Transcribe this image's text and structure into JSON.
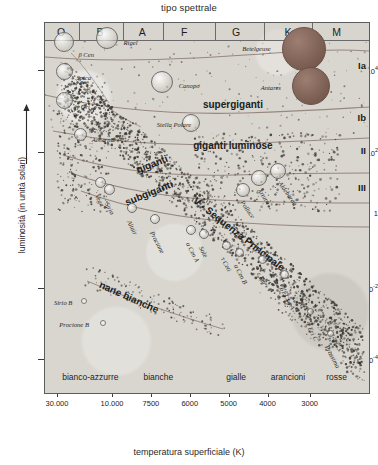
{
  "titles": {
    "top": "tipo spettrale",
    "xlabel": "temperatura superficiale (K)",
    "ylabel": "luminosità (in unità solari)"
  },
  "chart_data": {
    "type": "scatter",
    "xlabel": "temperatura superficiale (K)",
    "ylabel": "luminosità (in unità solari)",
    "top_axis_label": "tipo spettrale",
    "x_axis_inverted": true,
    "x_scale": "log-temperature (decreasing)",
    "y_scale": "log",
    "ylim": [
      "1e-4",
      "1e5"
    ],
    "xlim": [
      40000,
      2500
    ],
    "grid": false,
    "legend": "none",
    "spectral_types": [
      {
        "label": "O",
        "x_pct": 5
      },
      {
        "label": "B",
        "x_pct": 17
      },
      {
        "label": "A",
        "x_pct": 30
      },
      {
        "label": "F",
        "x_pct": 43
      },
      {
        "label": "G",
        "x_pct": 59
      },
      {
        "label": "K",
        "x_pct": 75
      },
      {
        "label": "M",
        "x_pct": 90
      }
    ],
    "spectral_dividers_pct": [
      10.5,
      24,
      36.5,
      52.5,
      67.5,
      82.5
    ],
    "color_classes": [
      {
        "label": "bianco-azzurre",
        "x_pct": 14
      },
      {
        "label": "bianche",
        "x_pct": 35
      },
      {
        "label": "gialle",
        "x_pct": 59
      },
      {
        "label": "arancioni",
        "x_pct": 75
      },
      {
        "label": "rosse",
        "x_pct": 90
      }
    ],
    "x_ticks": [
      {
        "label": "30.000",
        "x_pct": 4
      },
      {
        "label": "10.000",
        "x_pct": 21
      },
      {
        "label": "7500",
        "x_pct": 33
      },
      {
        "label": "6000",
        "x_pct": 45
      },
      {
        "label": "5000",
        "x_pct": 57
      },
      {
        "label": "4000",
        "x_pct": 69
      },
      {
        "label": "3000",
        "x_pct": 82
      }
    ],
    "y_ticks": [
      {
        "mantissa": "10",
        "exponent": "4",
        "y_pct": 13
      },
      {
        "mantissa": "10",
        "exponent": "2",
        "y_pct": 35
      },
      {
        "mantissa": "1",
        "exponent": "",
        "y_pct": 52
      },
      {
        "mantissa": "10",
        "exponent": "-2",
        "y_pct": 72
      },
      {
        "mantissa": "10",
        "exponent": "-4",
        "y_pct": 91
      }
    ],
    "luminosity_classes": [
      {
        "label": "Ia",
        "y_pct": 10
      },
      {
        "label": "Ib",
        "y_pct": 24
      },
      {
        "label": "II",
        "y_pct": 33
      },
      {
        "label": "III",
        "y_pct": 43
      }
    ],
    "regions": [
      {
        "label": "supergiganti",
        "x_pct": 58,
        "y_pct": 22,
        "rotation": 0,
        "size": "big"
      },
      {
        "label": "giganti luminose",
        "x_pct": 58,
        "y_pct": 33,
        "rotation": 0,
        "size": "big"
      },
      {
        "label": "giganti",
        "x_pct": 33,
        "y_pct": 38,
        "rotation": -22,
        "size": "big"
      },
      {
        "label": "subgiganti",
        "x_pct": 32,
        "y_pct": 46,
        "rotation": -22,
        "size": "big"
      },
      {
        "label": "V - Sequenza Principale",
        "x_pct": 60,
        "y_pct": 57,
        "rotation": 38,
        "size": "big"
      },
      {
        "label": "nane bianche",
        "x_pct": 26,
        "y_pct": 74,
        "rotation": 24,
        "size": "big"
      }
    ],
    "stars": [
      {
        "name": "β Cen",
        "x_pct": 6,
        "y_pct": 5,
        "r": 10,
        "label_dx": 14,
        "label_dy": 9,
        "rot": 0
      },
      {
        "name": "Rigel",
        "x_pct": 19,
        "y_pct": 4,
        "r": 11,
        "label_dx": 17,
        "label_dy": 1,
        "rot": 0
      },
      {
        "name": "Spica",
        "x_pct": 6,
        "y_pct": 13,
        "r": 8.5,
        "label_dx": 12,
        "label_dy": 3,
        "rot": 0
      },
      {
        "name": "γ Ori",
        "x_pct": 6,
        "y_pct": 21,
        "r": 8.5,
        "label_dx": 12,
        "label_dy": 2,
        "rot": 0
      },
      {
        "name": "Canopo",
        "x_pct": 36,
        "y_pct": 16,
        "r": 11,
        "label_dx": 17,
        "label_dy": 0,
        "rot": 0
      },
      {
        "name": "Stella Polare",
        "x_pct": 45,
        "y_pct": 27,
        "r": 9,
        "label_dx": -34,
        "label_dy": -2,
        "rot": 0
      },
      {
        "name": "Achernar",
        "x_pct": 11,
        "y_pct": 30,
        "r": 6.5,
        "label_dx": 11,
        "label_dy": 2,
        "rot": 0
      },
      {
        "name": "Betelgeuse",
        "x_pct": 80,
        "y_pct": 7,
        "r": 22,
        "label_dx": -62,
        "label_dy": -4,
        "rot": 0
      },
      {
        "name": "Antares",
        "x_pct": 82,
        "y_pct": 17,
        "r": 19,
        "label_dx": -50,
        "label_dy": -2,
        "rot": 0
      },
      {
        "name": "Aldebaran",
        "x_pct": 72,
        "y_pct": 40,
        "r": 8,
        "label_dx": 5,
        "label_dy": 9,
        "rot": 55
      },
      {
        "name": "Arturo",
        "x_pct": 66,
        "y_pct": 42,
        "r": 8,
        "label_dx": 3,
        "label_dy": 9,
        "rot": 55
      },
      {
        "name": "Polluce",
        "x_pct": 61,
        "y_pct": 45,
        "r": 7,
        "label_dx": 2,
        "label_dy": 9,
        "rot": 55
      },
      {
        "name": "Vega",
        "x_pct": 17,
        "y_pct": 43,
        "r": 5.5,
        "label_dx": 0,
        "label_dy": 11,
        "rot": 62
      },
      {
        "name": "Sirio",
        "x_pct": 20,
        "y_pct": 45,
        "r": 5.5,
        "label_dx": 0,
        "label_dy": 11,
        "rot": 62
      },
      {
        "name": "Altair",
        "x_pct": 27,
        "y_pct": 50,
        "r": 5,
        "label_dx": 0,
        "label_dy": 11,
        "rot": 62
      },
      {
        "name": "Procione",
        "x_pct": 34,
        "y_pct": 53,
        "r": 5,
        "label_dx": 0,
        "label_dy": 11,
        "rot": 62
      },
      {
        "name": "α Cen A",
        "x_pct": 45,
        "y_pct": 56,
        "r": 5,
        "label_dx": 0,
        "label_dy": 11,
        "rot": 62
      },
      {
        "name": "Sole",
        "x_pct": 49,
        "y_pct": 57,
        "r": 5,
        "label_dx": 0,
        "label_dy": 11,
        "rot": 62
      },
      {
        "name": "τ Ceti",
        "x_pct": 56,
        "y_pct": 60,
        "r": 4.5,
        "label_dx": 0,
        "label_dy": 11,
        "rot": 62
      },
      {
        "name": "α Cen B",
        "x_pct": 60,
        "y_pct": 62,
        "r": 4.5,
        "label_dx": 0,
        "label_dy": 11,
        "rot": 62
      },
      {
        "name": "ε Eri",
        "x_pct": 67,
        "y_pct": 64,
        "r": 4.5,
        "label_dx": 0,
        "label_dy": 11,
        "rot": 62
      },
      {
        "name": "61 Cyg A",
        "x_pct": 74,
        "y_pct": 68,
        "r": 4.5,
        "label_dx": 0,
        "label_dy": 11,
        "rot": 62
      },
      {
        "name": "ε Eri C",
        "x_pct": 82,
        "y_pct": 78,
        "r": 3.5,
        "label_dx": 0,
        "label_dy": 10,
        "rot": 62
      },
      {
        "name": "Prossima",
        "x_pct": 88,
        "y_pct": 84,
        "r": 3.5,
        "label_dx": 0,
        "label_dy": 10,
        "rot": 62
      },
      {
        "name": "Sirio B",
        "x_pct": 12,
        "y_pct": 75,
        "r": 3,
        "label_dx": -30,
        "label_dy": -2,
        "rot": 0
      },
      {
        "name": "Procione B",
        "x_pct": 18,
        "y_pct": 81,
        "r": 3,
        "label_dx": -44,
        "label_dy": -2,
        "rot": 0
      }
    ]
  }
}
